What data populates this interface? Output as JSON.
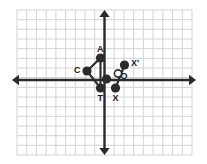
{
  "figure": {
    "background_color": "#ffffff",
    "grid": {
      "line_color": "#d4d4d4",
      "cell_size": 9.6,
      "left": 17,
      "top": 10,
      "right": 192,
      "bottom": 155,
      "columns": 18,
      "rows": 15,
      "visible": true
    },
    "axes": {
      "color": "#2b2b2b",
      "stroke_width": 2.4,
      "x_axis_y": 80,
      "y_axis_x": 104.5,
      "x_left_end": 12,
      "x_right_end": 196,
      "y_top_end": 10,
      "y_bottom_end": 155,
      "arrowheads": [
        "left",
        "right",
        "up",
        "down"
      ]
    },
    "shape": {
      "name": "triangle-ACT",
      "stroke_color": "#2b2b2b",
      "vertex_color": "#2b2b2b",
      "vertex_radius": 4.6,
      "edges": [
        [
          "A",
          "C"
        ],
        [
          "C",
          "T"
        ],
        [
          "A",
          "T"
        ]
      ]
    },
    "segment": {
      "name": "segment-X-Xprime",
      "stroke_color": "#2b2b2b",
      "from": "X",
      "to": "X'"
    },
    "points": [
      {
        "id": "A",
        "label": "A",
        "x": 100.5,
        "y": 58.0,
        "type": "filled",
        "label_dx": -3.5,
        "label_dy": -13.5
      },
      {
        "id": "C",
        "label": "C",
        "x": 87.0,
        "y": 71.0,
        "type": "filled",
        "label_dx": -13.0,
        "label_dy": -5.0
      },
      {
        "id": "T",
        "label": "T",
        "x": 100.5,
        "y": 88.0,
        "type": "filled",
        "label_dx": -3.0,
        "label_dy": 5.5
      },
      {
        "id": "M",
        "label": "",
        "x": 106.5,
        "y": 79.0,
        "type": "filled",
        "label_dx": 0,
        "label_dy": 0
      },
      {
        "id": "X",
        "label": "X",
        "x": 115.5,
        "y": 88.0,
        "type": "filled",
        "label_dx": -3.0,
        "label_dy": 5.5
      },
      {
        "id": "X'",
        "label": "X'",
        "x": 124.5,
        "y": 65.0,
        "type": "filled",
        "label_dx": 6.5,
        "label_dy": -6.5
      },
      {
        "id": "O",
        "label": "O",
        "x": 118.0,
        "y": 73.5,
        "type": "open",
        "label_dx": 2.5,
        "label_dy": -2.0
      }
    ]
  }
}
